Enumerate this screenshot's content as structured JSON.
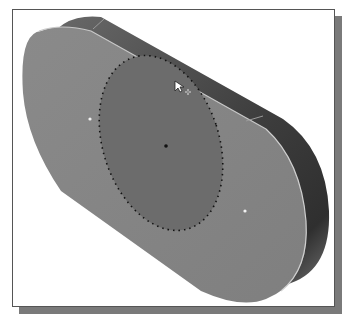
{
  "viewport": {
    "title": "3D model viewport",
    "model": "extruded slot part",
    "selection": "elliptical face region",
    "colors": {
      "background": "#ffffff",
      "frame": "#555555",
      "shadow": "#7a7a7a",
      "top_face": "#858585",
      "side_dark": "#4a4a4a",
      "side_light": "#6e6e6e",
      "selected_region": "#6f6f6f",
      "edge_highlight": "#c8c8c8",
      "selection_dots": "#111111"
    }
  },
  "cursor": {
    "type": "arrow-with-plus",
    "x": 178,
    "y": 87
  },
  "points": [
    {
      "name": "left-center-point",
      "x": 89,
      "y": 118
    },
    {
      "name": "ellipse-center-point",
      "x": 165,
      "y": 145
    },
    {
      "name": "right-center-point",
      "x": 244,
      "y": 210
    }
  ]
}
